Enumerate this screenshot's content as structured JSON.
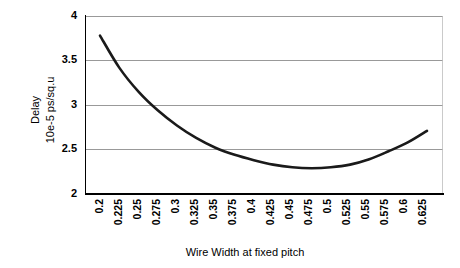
{
  "chart_data": {
    "type": "line",
    "title": "",
    "xlabel": "Wire Width at fixed pitch",
    "ylabel": "Delay\n10e-5 ps/sq.u",
    "ylabel_line1": "Delay",
    "ylabel_line2": "10e-5 ps/sq.u",
    "categories": [
      "0.2",
      "0.225",
      "0.25",
      "0.275",
      "0.3",
      "0.325",
      "0.35",
      "0.375",
      "0.4",
      "0.425",
      "0.45",
      "0.475",
      "0.5",
      "0.525",
      "0.55",
      "0.575",
      "0.6",
      "0.625"
    ],
    "x": [
      0.2,
      0.225,
      0.25,
      0.275,
      0.3,
      0.325,
      0.35,
      0.375,
      0.4,
      0.425,
      0.45,
      0.475,
      0.5,
      0.525,
      0.55,
      0.575,
      0.6,
      0.625
    ],
    "values": [
      3.78,
      3.42,
      3.15,
      2.94,
      2.77,
      2.63,
      2.52,
      2.44,
      2.38,
      2.33,
      2.3,
      2.29,
      2.3,
      2.33,
      2.39,
      2.48,
      2.58,
      2.71
    ],
    "series": [
      {
        "name": "Delay",
        "values": [
          3.78,
          3.42,
          3.15,
          2.94,
          2.77,
          2.63,
          2.52,
          2.44,
          2.38,
          2.33,
          2.3,
          2.29,
          2.3,
          2.33,
          2.39,
          2.48,
          2.58,
          2.71
        ]
      }
    ],
    "yticks": [
      "2",
      "2.5",
      "3",
      "3.5",
      "4"
    ],
    "ytick_values": [
      2,
      2.5,
      3,
      3.5,
      4
    ],
    "ylim": [
      2,
      4
    ],
    "xlim": [
      0.2,
      0.625
    ],
    "grid": true,
    "legend": false,
    "series_color": "#1a1a1a",
    "grid_color": "#808080",
    "axis_color": "#000000",
    "background": "#ffffff"
  }
}
